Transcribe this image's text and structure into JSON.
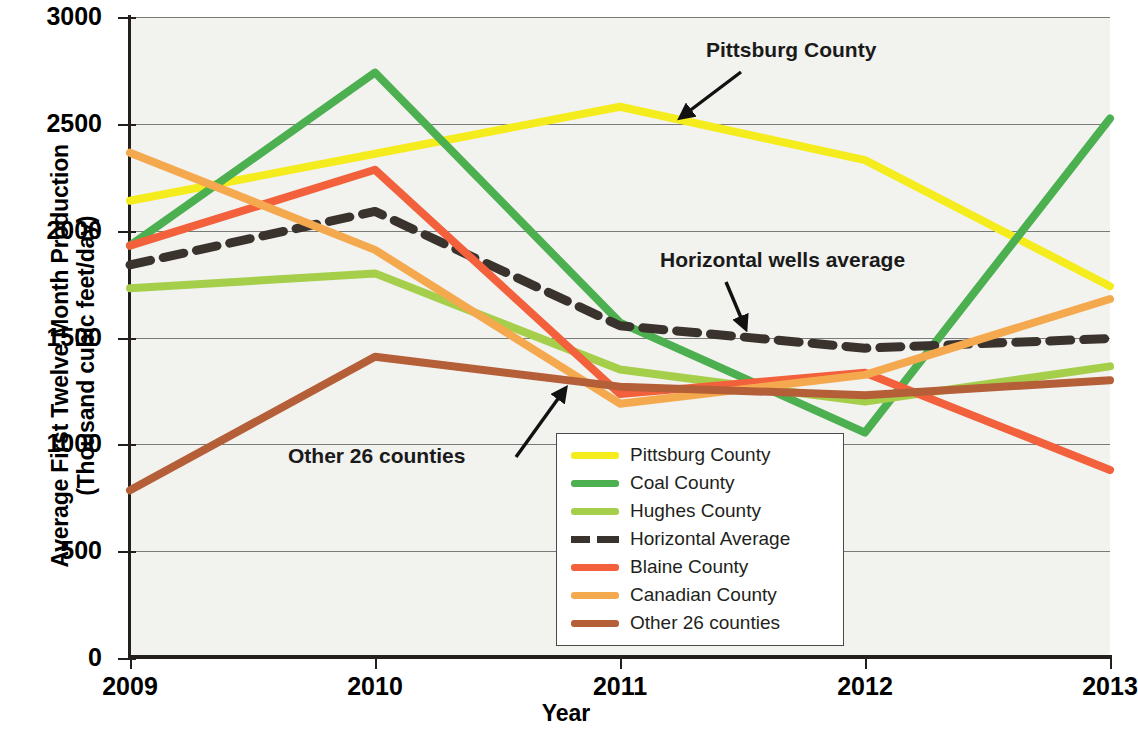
{
  "chart_data": {
    "type": "line",
    "title": "",
    "xlabel": "Year",
    "ylabel": "Average First Twelve Month Production\n(Thousand cubic feet/day)",
    "x": [
      2009,
      2010,
      2011,
      2012,
      2013
    ],
    "xticklabels": [
      "2009",
      "2010",
      "2011",
      "2012",
      "2013"
    ],
    "yticklabels": [
      "0",
      "500",
      "1000",
      "1500",
      "2000",
      "2500",
      "3000"
    ],
    "ylim": [
      0,
      3000
    ],
    "ytick_values": [
      0,
      500,
      1000,
      1500,
      2000,
      2500,
      3000
    ],
    "grid": true,
    "legend_position": "lower center",
    "series": [
      {
        "name": "Pittsburg County",
        "color": "#f5ec1e",
        "style": "solid",
        "values": [
          2140,
          2360,
          2580,
          2330,
          1740
        ]
      },
      {
        "name": "Coal County",
        "color": "#4cb050",
        "style": "solid",
        "values": [
          1930,
          2740,
          1570,
          1055,
          2525
        ]
      },
      {
        "name": "Hughes County",
        "color": "#a5cf4a",
        "style": "solid",
        "values": [
          1730,
          1800,
          1350,
          1200,
          1365
        ]
      },
      {
        "name": "Horizontal Average",
        "color": "#3a322c",
        "style": "dashed",
        "values": [
          1840,
          2090,
          1555,
          1450,
          1495
        ]
      },
      {
        "name": "Blaine County",
        "color": "#f2603c",
        "style": "solid",
        "values": [
          1930,
          2285,
          1235,
          1335,
          880
        ]
      },
      {
        "name": "Canadian County",
        "color": "#f5a94e",
        "style": "solid",
        "values": [
          2365,
          1910,
          1190,
          1325,
          1680
        ]
      },
      {
        "name": "Other 26 counties",
        "color": "#b55f38",
        "style": "solid",
        "values": [
          785,
          1410,
          1270,
          1230,
          1300
        ]
      }
    ],
    "annotations": [
      {
        "id": "pittsburg",
        "text": "Pittsburg County"
      },
      {
        "id": "horizontal",
        "text": "Horizontal wells average"
      },
      {
        "id": "other",
        "text": "Other 26 counties"
      }
    ]
  }
}
